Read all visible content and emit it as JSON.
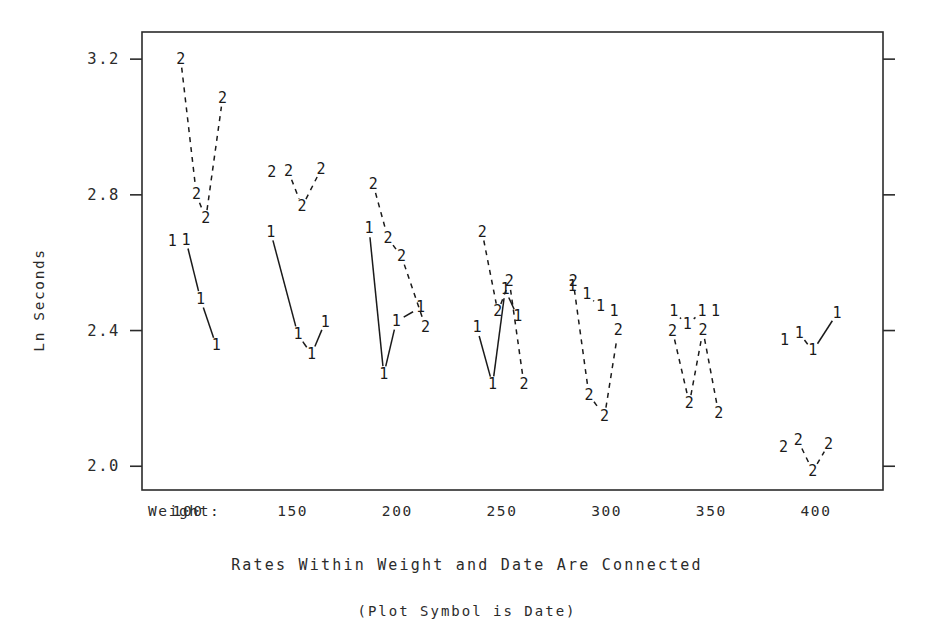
{
  "chart_data": {
    "type": "line",
    "title": "",
    "caption": "Rates Within Weight and Date Are Connected",
    "sub_caption": "(Plot Symbol is Date)",
    "xlabel": "Weight:",
    "ylabel": "Ln Seconds",
    "plot_symbol_note": "Plot Symbol is Date",
    "x_group_label_prefix": "Weight:",
    "x_tick_labels": [
      "100",
      "150",
      "200",
      "250",
      "300",
      "350",
      "400"
    ],
    "x_tick_values": [
      100,
      150,
      200,
      250,
      300,
      350,
      400
    ],
    "y_tick_labels": [
      "3.2",
      "2.8",
      "2.4",
      "2.0"
    ],
    "y_tick_values": [
      3.2,
      2.8,
      2.4,
      2.0
    ],
    "ylim": [
      1.93,
      3.28
    ],
    "xlim": [
      78,
      432
    ],
    "grid": false,
    "legend": "none",
    "line_color": "#1a1a1a",
    "axis_color": "#2b2b2b",
    "background": "#ffffff",
    "series": [
      {
        "name": "Date 1",
        "symbol": "1",
        "style": "solid",
        "groups": [
          {
            "weight": 100,
            "points": [
              {
                "x": 92.5,
                "y": 2.663
              },
              {
                "x": 99.0,
                "y": 2.666
              },
              {
                "x": 106.0,
                "y": 2.492
              },
              {
                "x": 113.5,
                "y": 2.355
              }
            ]
          },
          {
            "weight": 150,
            "points": [
              {
                "x": 139.5,
                "y": 2.69
              },
              {
                "x": 152.5,
                "y": 2.388
              },
              {
                "x": 159.0,
                "y": 2.33
              },
              {
                "x": 165.5,
                "y": 2.425
              }
            ]
          },
          {
            "weight": 200,
            "points": [
              {
                "x": 186.5,
                "y": 2.7
              },
              {
                "x": 193.5,
                "y": 2.27
              },
              {
                "x": 199.5,
                "y": 2.427
              },
              {
                "x": 211.0,
                "y": 2.468
              }
            ]
          },
          {
            "weight": 250,
            "points": [
              {
                "x": 238.0,
                "y": 2.408
              },
              {
                "x": 245.5,
                "y": 2.24
              },
              {
                "x": 251.5,
                "y": 2.52
              },
              {
                "x": 257.5,
                "y": 2.44
              }
            ]
          },
          {
            "weight": 300,
            "points": [
              {
                "x": 283.5,
                "y": 2.53
              },
              {
                "x": 290.5,
                "y": 2.505
              },
              {
                "x": 297.0,
                "y": 2.47
              },
              {
                "x": 303.5,
                "y": 2.455
              }
            ]
          },
          {
            "weight": 350,
            "points": [
              {
                "x": 332.0,
                "y": 2.455
              },
              {
                "x": 338.5,
                "y": 2.418
              },
              {
                "x": 345.5,
                "y": 2.455
              },
              {
                "x": 352.0,
                "y": 2.455
              }
            ]
          },
          {
            "weight": 400,
            "points": [
              {
                "x": 385.0,
                "y": 2.37
              },
              {
                "x": 392.0,
                "y": 2.392
              },
              {
                "x": 398.5,
                "y": 2.34
              },
              {
                "x": 410.0,
                "y": 2.45
              }
            ]
          }
        ]
      },
      {
        "name": "Date 2",
        "symbol": "2",
        "style": "dashed",
        "groups": [
          {
            "weight": 100,
            "points": [
              {
                "x": 96.5,
                "y": 3.2
              },
              {
                "x": 104.0,
                "y": 2.8
              },
              {
                "x": 108.5,
                "y": 2.73
              },
              {
                "x": 116.5,
                "y": 3.085
              }
            ]
          },
          {
            "weight": 150,
            "points": [
              {
                "x": 140.0,
                "y": 2.865
              },
              {
                "x": 148.0,
                "y": 2.868
              },
              {
                "x": 154.5,
                "y": 2.765
              },
              {
                "x": 163.5,
                "y": 2.875
              }
            ]
          },
          {
            "weight": 200,
            "points": [
              {
                "x": 188.5,
                "y": 2.83
              },
              {
                "x": 195.5,
                "y": 2.672
              },
              {
                "x": 202.0,
                "y": 2.618
              },
              {
                "x": 213.5,
                "y": 2.41
              }
            ]
          },
          {
            "weight": 250,
            "points": [
              {
                "x": 240.5,
                "y": 2.69
              },
              {
                "x": 248.0,
                "y": 2.455
              },
              {
                "x": 253.5,
                "y": 2.545
              },
              {
                "x": 260.5,
                "y": 2.24
              }
            ]
          },
          {
            "weight": 300,
            "points": [
              {
                "x": 284.0,
                "y": 2.545
              },
              {
                "x": 291.5,
                "y": 2.21
              },
              {
                "x": 299.0,
                "y": 2.148
              },
              {
                "x": 305.5,
                "y": 2.4
              }
            ]
          },
          {
            "weight": 350,
            "points": [
              {
                "x": 331.5,
                "y": 2.398
              },
              {
                "x": 339.5,
                "y": 2.185
              },
              {
                "x": 346.0,
                "y": 2.4
              },
              {
                "x": 353.5,
                "y": 2.155
              }
            ]
          },
          {
            "weight": 400,
            "points": [
              {
                "x": 384.5,
                "y": 2.055
              },
              {
                "x": 391.5,
                "y": 2.075
              },
              {
                "x": 398.5,
                "y": 1.985
              },
              {
                "x": 406.0,
                "y": 2.065
              }
            ]
          }
        ]
      }
    ]
  },
  "axes": {
    "y_axis_title": "Ln Seconds",
    "x_axis_prefix": "Weight:"
  },
  "captions": {
    "main": "Rates Within Weight and Date Are Connected",
    "sub": "(Plot Symbol is Date)"
  }
}
